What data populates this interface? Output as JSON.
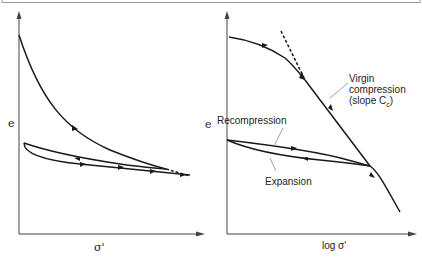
{
  "panels": [
    {
      "id": "left",
      "y_label": "e",
      "x_label": "σ'",
      "description": "Void ratio vs effective stress (linear scale)"
    },
    {
      "id": "right",
      "y_label": "e",
      "x_label": "log σ'",
      "description": "Void ratio vs log effective stress",
      "annotations": {
        "virgin_line1": "Virgin",
        "virgin_line2": "compression",
        "virgin_line3": "(slope C",
        "virgin_sub": "c",
        "virgin_close": ")",
        "recompression": "Recompression",
        "expansion": "Expansion"
      }
    }
  ],
  "colors": {
    "line": "#1a1a1a",
    "frame": "#9a9a9a",
    "background": "#ffffff"
  }
}
